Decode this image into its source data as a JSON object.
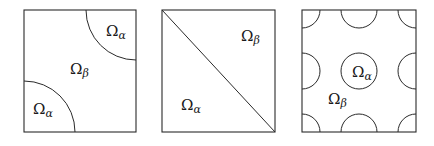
{
  "figure": {
    "panels": [
      {
        "name": "quarter-circle-inclusions",
        "labels": [
          {
            "omega": "Ω",
            "sub": "α",
            "x": 33,
            "y": 114
          },
          {
            "omega": "Ω",
            "sub": "β",
            "x": 70,
            "y": 74
          },
          {
            "omega": "Ω",
            "sub": "α",
            "x": 106,
            "y": 36
          }
        ]
      },
      {
        "name": "diagonal-split",
        "labels": [
          {
            "omega": "Ω",
            "sub": "β",
            "x": 241,
            "y": 41
          },
          {
            "omega": "Ω",
            "sub": "α",
            "x": 181,
            "y": 110
          }
        ]
      },
      {
        "name": "periodic-circle-inclusions",
        "labels": [
          {
            "omega": "Ω",
            "sub": "α",
            "x": 352,
            "y": 77
          },
          {
            "omega": "Ω",
            "sub": "β",
            "x": 328,
            "y": 104
          }
        ]
      }
    ]
  }
}
